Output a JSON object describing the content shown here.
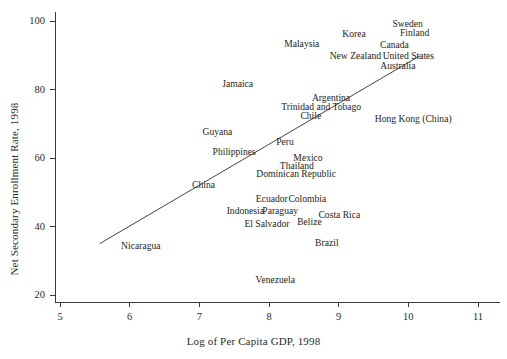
{
  "chart_data": {
    "type": "scatter",
    "title": "",
    "xlabel": "Log of Per Capita GDP, 1998",
    "ylabel": "Net Secondary Enrollment Rate, 1998",
    "xlim": [
      5,
      11
    ],
    "ylim": [
      18,
      103
    ],
    "xticks": [
      5,
      6,
      7,
      8,
      9,
      10,
      11
    ],
    "xtick_labels": [
      "5",
      "6",
      "7",
      "8",
      "9",
      "10",
      "11"
    ],
    "yticks": [
      20,
      40,
      60,
      80,
      100
    ],
    "ytick_labels": [
      "20",
      "40",
      "60",
      "80",
      "100"
    ],
    "grid": false,
    "legend": null,
    "marker_style": "text-label",
    "trendline": {
      "name": "regression-line",
      "x_start": 5.57,
      "y_start": 35.0,
      "x_end": 10.17,
      "y_end": 89.9
    },
    "points": [
      {
        "label": "Korea",
        "x": 9.22,
        "y": 96.2
      },
      {
        "label": "Sweden",
        "x": 9.99,
        "y": 99.0
      },
      {
        "label": "Finland",
        "x": 10.09,
        "y": 96.5
      },
      {
        "label": "Malaysia",
        "x": 8.47,
        "y": 93.4
      },
      {
        "label": "Canada",
        "x": 9.8,
        "y": 93.0
      },
      {
        "label": "New Zealand",
        "x": 9.24,
        "y": 89.8
      },
      {
        "label": "United States",
        "x": 10.0,
        "y": 89.8
      },
      {
        "label": "Australia",
        "x": 9.85,
        "y": 87.0
      },
      {
        "label": "Jamaica",
        "x": 7.55,
        "y": 81.7
      },
      {
        "label": "Argentina",
        "x": 8.89,
        "y": 77.6
      },
      {
        "label": "Trinidad and Tobago",
        "x": 8.75,
        "y": 74.8
      },
      {
        "label": "Chile",
        "x": 8.6,
        "y": 72.4
      },
      {
        "label": "Hong Kong (China)",
        "x": 10.07,
        "y": 71.5
      },
      {
        "label": "Guyana",
        "x": 7.26,
        "y": 67.5
      },
      {
        "label": "Peru",
        "x": 8.23,
        "y": 64.6
      },
      {
        "label": "Philippines",
        "x": 7.5,
        "y": 61.7
      },
      {
        "label": "Mexico",
        "x": 8.56,
        "y": 60.0
      },
      {
        "label": "Thailand",
        "x": 8.4,
        "y": 57.6
      },
      {
        "label": "Dominican Republic",
        "x": 8.39,
        "y": 55.3
      },
      {
        "label": "China",
        "x": 7.06,
        "y": 52.2
      },
      {
        "label": "Ecuador",
        "x": 8.04,
        "y": 48.0
      },
      {
        "label": "Colombia",
        "x": 8.55,
        "y": 48.0
      },
      {
        "label": "Indonesia",
        "x": 7.66,
        "y": 44.5
      },
      {
        "label": "Paraguay",
        "x": 8.16,
        "y": 44.5
      },
      {
        "label": "Costa Rica",
        "x": 9.01,
        "y": 43.4
      },
      {
        "label": "El Salvador",
        "x": 7.97,
        "y": 40.8
      },
      {
        "label": "Belize",
        "x": 8.58,
        "y": 41.4
      },
      {
        "label": "Nicaragua",
        "x": 6.16,
        "y": 34.4
      },
      {
        "label": "Brazil",
        "x": 8.83,
        "y": 35.2
      },
      {
        "label": "Venezuela",
        "x": 8.09,
        "y": 24.4
      }
    ]
  },
  "style": {
    "axis_color": "#3a3a3a",
    "text_color": "#242424",
    "trendline_color": "#2e2e2e",
    "background": "#ffffff"
  }
}
